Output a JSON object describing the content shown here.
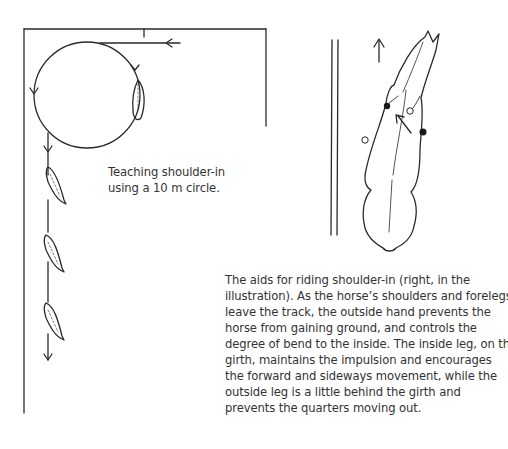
{
  "figure_left": {
    "title": "Teaching shoulder-in using a 10 m circle diagram",
    "caption_lines": [
      "Teaching shoulder-in",
      "using a 10 m circle."
    ]
  },
  "figure_right": {
    "title": "Aids for riding shoulder-in diagram",
    "caption_lines": [
      "The aids for riding shoulder-in (right, in the",
      "illustration). As the horse’s shoulders and forelegs",
      "leave the track, the outside hand prevents the",
      "horse from gaining ground, and controls the",
      "degree of bend to the inside. The inside leg, on the",
      "girth, maintains the impulsion and encourages",
      "the forward and sideways movement, while the",
      "outside leg is a little behind the girth and",
      "prevents the quarters moving out."
    ]
  },
  "colors": {
    "line": "#2a2a2a",
    "text": "#333333",
    "background": "#ffffff"
  }
}
